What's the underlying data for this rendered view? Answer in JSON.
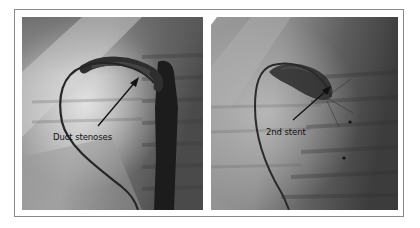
{
  "figure": {
    "panels": [
      {
        "id": "left",
        "description": "fluoroscopy-angiogram",
        "annotation": "Duct stenoses",
        "arrow_color": "#111111"
      },
      {
        "id": "right",
        "description": "fluoroscopy-angiogram",
        "annotation": "2nd stent",
        "arrow_color": "#111111"
      }
    ],
    "colors": {
      "frame_border": "#8a8a8a",
      "background": "#ffffff"
    }
  }
}
